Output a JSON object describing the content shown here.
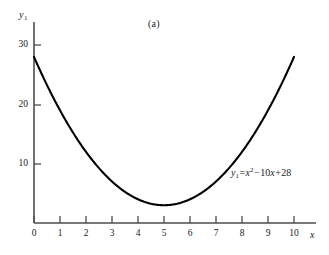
{
  "figure": {
    "panel_label": "(a)",
    "background_color": "#ffffff",
    "curve_color": "#000000",
    "axis_color": "#4d4d4d"
  },
  "annotation": {
    "equation_text": "y₁ = x² − 10x + 28",
    "lhs_var": "y",
    "lhs_sub": "1",
    "equals": "=",
    "term_x": "x",
    "exponent": "2",
    "minus": "−",
    "coefficient": "10",
    "term_x2": "x",
    "plus": "+",
    "constant": "28"
  },
  "chart_data": {
    "type": "line",
    "title": "(a)",
    "subtitle": "",
    "xlabel": "x",
    "ylabel": "y₁",
    "equation": "y1 = x^2 - 10x + 28",
    "grid": false,
    "legend": false,
    "legend_position": "none",
    "xlim": [
      0,
      10.6
    ],
    "ylim": [
      0,
      33
    ],
    "xticks": [
      0,
      1,
      2,
      3,
      4,
      5,
      6,
      7,
      8,
      9,
      10
    ],
    "xtick_labels": [
      "0",
      "1",
      "2",
      "3",
      "4",
      "5",
      "6",
      "7",
      "8",
      "9",
      "10"
    ],
    "yticks": [
      10,
      20,
      30
    ],
    "ytick_labels": [
      "10",
      "20",
      "30"
    ],
    "vertex": [
      5,
      3
    ],
    "series": [
      {
        "name": "y1 = x^2 - 10x + 28",
        "x": [
          0,
          0.5,
          1,
          1.5,
          2,
          2.5,
          3,
          3.5,
          4,
          4.5,
          5,
          5.5,
          6,
          6.5,
          7,
          7.5,
          8,
          8.5,
          9,
          9.5,
          10
        ],
        "values": [
          28,
          23.25,
          19,
          15.25,
          12,
          9.25,
          7,
          5.25,
          4,
          3.25,
          3,
          3.25,
          4,
          5.25,
          7,
          9.25,
          12,
          15.25,
          19,
          23.25,
          28
        ]
      }
    ]
  }
}
